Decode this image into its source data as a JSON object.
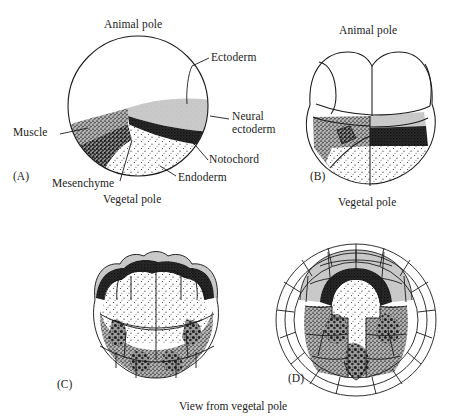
{
  "figure": {
    "caption_bottom": "View from vegetal pole"
  },
  "panels": {
    "a": {
      "letter": "(A)",
      "pole_top": "Animal pole",
      "pole_bottom": "Vegetal pole",
      "labels": {
        "ectoderm": "Ectoderm",
        "neural_ectoderm": "Neural ectoderm",
        "notochord": "Notochord",
        "endoderm": "Endoderm",
        "mesenchyme": "Mesenchyme",
        "muscle": "Muscle"
      }
    },
    "b": {
      "letter": "(B)",
      "pole_top": "Animal pole",
      "pole_bottom": "Vegetal pole"
    },
    "c": {
      "letter": "(C)"
    },
    "d": {
      "letter": "(D)"
    }
  },
  "tissue_colors": {
    "ectoderm": "#ffffff",
    "neural_ectoderm": "#c8c8c8",
    "notochord": "#2b2b2b",
    "endoderm": "#fdfdfd",
    "mesenchyme": "#555555",
    "muscle": "#8a8a8a",
    "outline": "#1b1b1b"
  }
}
